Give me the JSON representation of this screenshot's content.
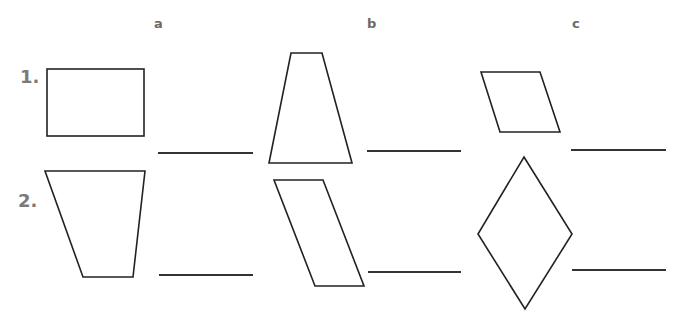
{
  "worksheet": {
    "columns": [
      {
        "label": "a"
      },
      {
        "label": "b"
      },
      {
        "label": "c"
      }
    ],
    "rows": [
      {
        "label": "1.",
        "items": [
          {
            "shape": "rectangle",
            "answer": ""
          },
          {
            "shape": "trapezoid",
            "answer": ""
          },
          {
            "shape": "parallelogram",
            "answer": ""
          }
        ]
      },
      {
        "label": "2.",
        "items": [
          {
            "shape": "trapezoid",
            "answer": ""
          },
          {
            "shape": "parallelogram",
            "answer": ""
          },
          {
            "shape": "rhombus",
            "answer": ""
          }
        ]
      }
    ]
  }
}
